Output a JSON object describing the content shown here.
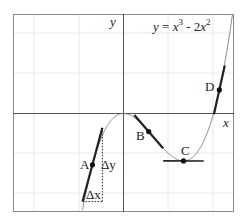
{
  "figure": {
    "function_label": "y = x³ - 2x²",
    "function_parts": {
      "y": "y",
      "eq": " = ",
      "x1": "x",
      "exp1": "3",
      "minus": " - 2",
      "x2": "x",
      "exp2": "2"
    },
    "axis_x_label": "x",
    "axis_y_label": "y",
    "points": [
      {
        "label": "A",
        "x": -0.69,
        "description": "secant/tangent with Δx, Δy"
      },
      {
        "label": "B",
        "x": 0.56
      },
      {
        "label": "C",
        "x": 1.333,
        "description": "horizontal tangent (local minimum)"
      },
      {
        "label": "D",
        "x": 2.13
      }
    ],
    "delta_x_label": "Δx",
    "delta_y_label": "Δy",
    "colors": {
      "curve": "#777777",
      "tangent": "#222222",
      "grid": "#e6e6e6",
      "axis": "#555555",
      "frame": "#888888"
    }
  }
}
